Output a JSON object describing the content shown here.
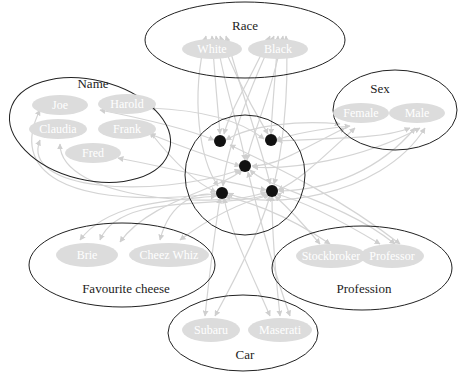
{
  "diagram": {
    "hub": {
      "label": "",
      "node_count": 5
    },
    "groups": [
      {
        "id": "race",
        "label": "Race",
        "values": [
          "White",
          "Black"
        ]
      },
      {
        "id": "sex",
        "label": "Sex",
        "values": [
          "Female",
          "Male"
        ]
      },
      {
        "id": "name",
        "label": "Name",
        "values": [
          "Joe",
          "Harold",
          "Claudia",
          "Frank",
          "Fred"
        ]
      },
      {
        "id": "cheese",
        "label": "Favourite cheese",
        "values": [
          "Brie",
          "Cheez Whiz"
        ]
      },
      {
        "id": "profession",
        "label": "Profession",
        "values": [
          "Stockbroker",
          "Professor"
        ]
      },
      {
        "id": "car",
        "label": "Car",
        "values": [
          "Subaru",
          "Maserati"
        ]
      }
    ],
    "colors": {
      "edge": "#d4d4d4",
      "pill": "#dcdcdc",
      "node": "#111111",
      "outline": "#222222"
    }
  }
}
